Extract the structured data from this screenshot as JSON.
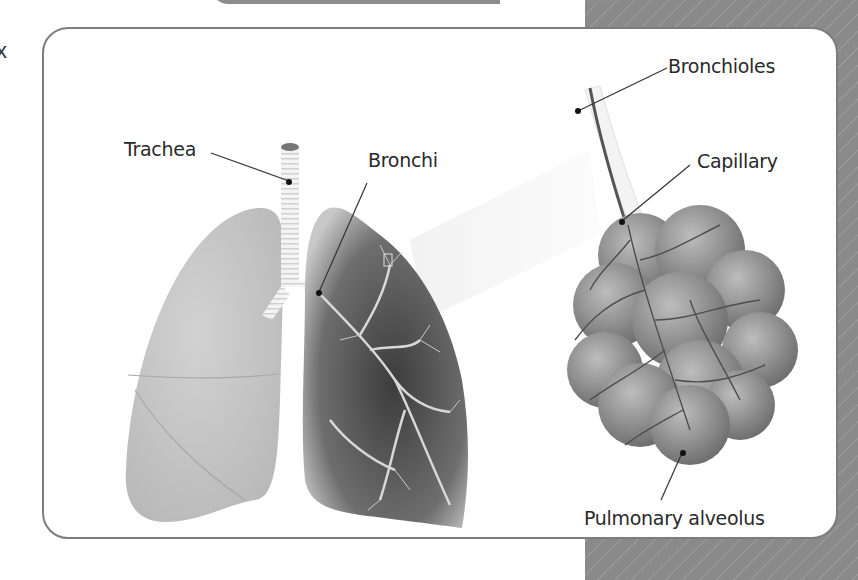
{
  "diagram": {
    "labels": {
      "trachea": "Trachea",
      "bronchi": "Bronchi",
      "bronchioles": "Bronchioles",
      "capillary": "Capillary",
      "alveolus": "Pulmonary alveolus"
    },
    "edge_text": "x",
    "colors": {
      "panel_border": "#7d7d7d",
      "background_stripe": "#8a8a8a",
      "lung_light": "#c4c4c4",
      "lung_dark": "#555555",
      "alveoli": "#8f8f8f",
      "text": "#2a2a2a"
    }
  }
}
